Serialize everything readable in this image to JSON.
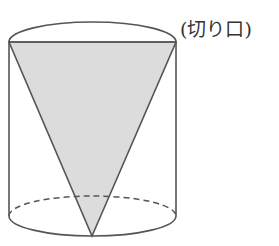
{
  "figure": {
    "label": "(切り口)",
    "cut_off_top_text": "",
    "colors": {
      "stroke": "#555555",
      "fill": "#dcdcdc",
      "background": "#ffffff"
    },
    "cylinder": {
      "left_x": 9,
      "right_x": 176,
      "top_ellipse_cy": 42,
      "top_ellipse_ry": 20,
      "bottom_ellipse_cy": 216,
      "bottom_ellipse_ry": 20
    },
    "triangle": {
      "points": [
        [
          9,
          42
        ],
        [
          176,
          42
        ],
        [
          92,
          236
        ]
      ]
    }
  }
}
